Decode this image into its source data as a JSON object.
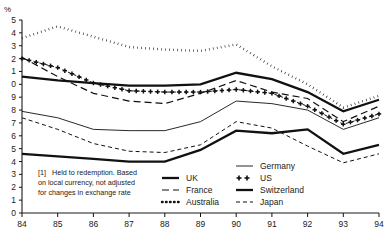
{
  "chart_data": {
    "type": "line",
    "title": "",
    "xlabel": "",
    "ylabel": "%",
    "ylim": [
      0,
      15
    ],
    "xlim": [
      84,
      94
    ],
    "grid": false,
    "legend_position": "bottom-center",
    "x": [
      84,
      85,
      86,
      87,
      88,
      89,
      90,
      91,
      92,
      93,
      94
    ],
    "xtick_labels": [
      "84",
      "85",
      "86",
      "87",
      "88",
      "89",
      "90",
      "91",
      "92",
      "93",
      "94"
    ],
    "ytick_labels": [
      "5",
      "4",
      "3",
      "2",
      "1",
      "0",
      "9",
      "8",
      "7",
      "6",
      "5",
      "4",
      "3",
      "2",
      "1",
      "0"
    ],
    "ytick_values": [
      15,
      14,
      13,
      12,
      11,
      10,
      9,
      8,
      7,
      6,
      5,
      4,
      3,
      2,
      1,
      0
    ],
    "series": [
      {
        "name": "UK",
        "style": "thick-solid",
        "values": [
          10.6,
          10.3,
          10.1,
          9.9,
          9.9,
          10.0,
          10.9,
          10.4,
          9.4,
          7.9,
          8.8
        ]
      },
      {
        "name": "France",
        "style": "dashed",
        "values": [
          12.1,
          10.6,
          9.3,
          8.7,
          8.5,
          9.3,
          10.3,
          9.4,
          8.9,
          7.1,
          8.3
        ]
      },
      {
        "name": "Australia",
        "style": "dotted",
        "values": [
          13.6,
          14.5,
          13.7,
          12.9,
          12.7,
          12.6,
          13.1,
          11.4,
          10.0,
          8.2,
          9.1
        ]
      },
      {
        "name": "Germany",
        "style": "thin-solid",
        "values": [
          7.9,
          7.4,
          6.5,
          6.4,
          6.4,
          7.1,
          8.7,
          8.5,
          8.0,
          6.5,
          7.4
        ]
      },
      {
        "name": "US",
        "style": "plus-markers",
        "values": [
          12.0,
          11.3,
          10.1,
          9.5,
          9.4,
          9.4,
          9.6,
          9.3,
          8.3,
          6.9,
          7.7
        ]
      },
      {
        "name": "Switzerland",
        "style": "thick-solid-low",
        "values": [
          4.6,
          4.4,
          4.2,
          4.0,
          4.0,
          4.9,
          6.4,
          6.2,
          6.5,
          4.6,
          5.3
        ]
      },
      {
        "name": "Japan",
        "style": "fine-dashed",
        "values": [
          7.4,
          6.5,
          5.4,
          4.8,
          4.7,
          5.3,
          7.1,
          6.6,
          5.2,
          3.9,
          4.6
        ]
      }
    ]
  },
  "axis": {
    "unit_label": "%"
  },
  "footnote": {
    "marker": "[1]",
    "line1": "Held to redemption. Based",
    "line2": "on local currency, not adjusted",
    "line3": "for changes in exchange rate"
  },
  "legend": {
    "column1": [
      {
        "label": "UK",
        "swatch": "thick-solid"
      },
      {
        "label": "France",
        "swatch": "dashed"
      },
      {
        "label": "Australia",
        "swatch": "dotted"
      }
    ],
    "column2": [
      {
        "label": "Germany",
        "swatch": "thin-solid"
      },
      {
        "label": "US",
        "swatch": "plus-markers"
      },
      {
        "label": "Switzerland",
        "swatch": "thick-solid"
      },
      {
        "label": "Japan",
        "swatch": "fine-dashed"
      }
    ]
  },
  "colors": {
    "ink": "#111111",
    "background": "#ffffff"
  }
}
